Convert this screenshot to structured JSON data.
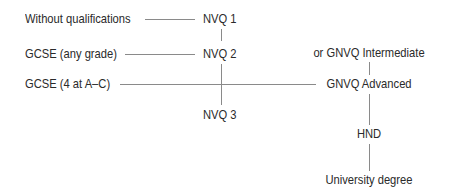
{
  "diagram": {
    "type": "qualification-pathway",
    "left_entries": [
      {
        "label": "Without qualifications",
        "leads_to": "NVQ 1"
      },
      {
        "label": "GCSE (any grade)",
        "leads_to": "NVQ 2"
      },
      {
        "label": "GCSE (4 at A–C)",
        "leads_to": "GNVQ Advanced"
      }
    ],
    "nvq_column": [
      {
        "label": "NVQ 1"
      },
      {
        "label": "NVQ 2"
      },
      {
        "label": "NVQ 3"
      }
    ],
    "gnvq_column": [
      {
        "label": "or GNVQ Intermediate"
      },
      {
        "label": "GNVQ Advanced"
      },
      {
        "label": "HND"
      },
      {
        "label": "University degree"
      }
    ],
    "line_color": "#8a8a8a",
    "text_color": "#2a2a2a"
  }
}
